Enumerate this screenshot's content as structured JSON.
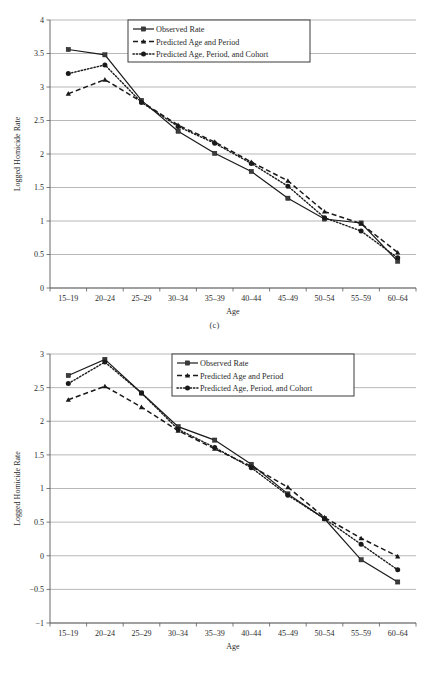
{
  "figures": [
    {
      "id": "c",
      "caption": "(c)",
      "xlabel": "Age",
      "ylabel": "Logged Homicide Rate",
      "legend": [
        "Observed Rate",
        "Predicted Age and Period",
        "Predicted Age, Period, and Cohort"
      ]
    },
    {
      "id": "d",
      "caption": "(d)",
      "xlabel": "Age",
      "ylabel": "Logged Homicide Rate",
      "legend": [
        "Observed Rate",
        "Predicted Age and Period",
        "Predicted Age, Period, and Cohort"
      ]
    }
  ],
  "chart_data": [
    {
      "type": "line",
      "title": "(c)",
      "xlabel": "Age",
      "ylabel": "Logged Homicide Rate",
      "categories": [
        "15–19",
        "20–24",
        "25–29",
        "30–34",
        "35–39",
        "40–44",
        "45–49",
        "50–54",
        "55–59",
        "60–64"
      ],
      "ylim": [
        0,
        4
      ],
      "yticks": [
        0,
        0.5,
        1,
        1.5,
        2,
        2.5,
        3,
        3.5,
        4
      ],
      "ytick_labels": [
        "0",
        "0.5",
        "1",
        "1.5",
        "2",
        "2.5",
        "3",
        "3.5",
        "4"
      ],
      "grid": true,
      "legend_position": "top-center",
      "series": [
        {
          "name": "Observed Rate",
          "style": "solid",
          "marker": "square",
          "values": [
            3.56,
            3.48,
            2.8,
            2.34,
            2.01,
            1.74,
            1.34,
            1.03,
            0.97,
            0.4
          ]
        },
        {
          "name": "Predicted Age and Period",
          "style": "dashed",
          "marker": "triangle",
          "values": [
            2.9,
            3.11,
            2.78,
            2.43,
            2.18,
            1.88,
            1.6,
            1.14,
            0.96,
            0.53
          ]
        },
        {
          "name": "Predicted Age, Period, and Cohort",
          "style": "dotted",
          "marker": "circle",
          "values": [
            3.2,
            3.33,
            2.77,
            2.41,
            2.16,
            1.86,
            1.52,
            1.05,
            0.85,
            0.45
          ]
        }
      ]
    },
    {
      "type": "line",
      "title": "(d)",
      "xlabel": "Age",
      "ylabel": "Logged Homicide Rate",
      "categories": [
        "15–19",
        "20–24",
        "25–29",
        "30–34",
        "35–39",
        "40–44",
        "45–49",
        "50–54",
        "55–59",
        "60–64"
      ],
      "ylim": [
        -1,
        3
      ],
      "yticks": [
        -1,
        -0.5,
        0,
        0.5,
        1,
        1.5,
        2,
        2.5,
        3
      ],
      "ytick_labels": [
        "−1",
        "−0.5",
        "0",
        "0.5",
        "1",
        "1.5",
        "2",
        "2.5",
        "3"
      ],
      "grid": true,
      "legend_position": "top-center",
      "series": [
        {
          "name": "Observed Rate",
          "style": "solid",
          "marker": "square",
          "values": [
            2.68,
            2.92,
            2.42,
            1.92,
            1.72,
            1.36,
            0.92,
            0.55,
            -0.06,
            -0.39
          ]
        },
        {
          "name": "Predicted Age and Period",
          "style": "dashed",
          "marker": "triangle",
          "values": [
            2.32,
            2.52,
            2.21,
            1.86,
            1.59,
            1.33,
            1.02,
            0.57,
            0.26,
            -0.01
          ]
        },
        {
          "name": "Predicted Age, Period, and Cohort",
          "style": "dotted",
          "marker": "circle",
          "values": [
            2.56,
            2.88,
            2.42,
            1.88,
            1.61,
            1.31,
            0.9,
            0.55,
            0.17,
            -0.21
          ]
        }
      ]
    }
  ]
}
